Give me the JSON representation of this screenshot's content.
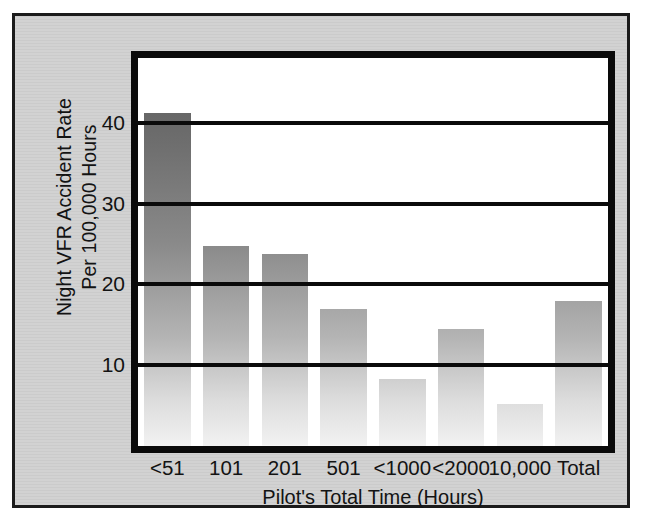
{
  "chart_data": {
    "type": "bar",
    "title": "",
    "xlabel": "Pilot's Total Time (Hours)",
    "ylabel_line1": "Night VFR Accident Rate",
    "ylabel_line2": "Per 100,000 Hours",
    "categories": [
      "<51",
      "101",
      "201",
      "501",
      "<1000",
      "<2000",
      "10,000",
      "Total"
    ],
    "values": [
      41.2,
      24.8,
      23.7,
      16.9,
      8.3,
      14.5,
      5.2,
      18.0
    ],
    "yticks": [
      10,
      20,
      30,
      40
    ],
    "ylim": [
      0,
      48
    ],
    "grid": true,
    "legend": "none",
    "bar_fill": "gray-vertical-gradient",
    "frame_color": "#0a0a0a",
    "panel_background": "#d2d2d2",
    "plot_background": "#ffffff"
  }
}
